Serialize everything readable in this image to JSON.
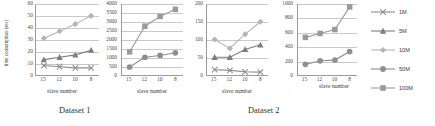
{
  "figure": {
    "captions": [
      {
        "label": "Dataset 1"
      },
      {
        "label": "Dataset 2"
      }
    ],
    "y_axis_title": "time consumption (sec)",
    "x_axis_title": "slave number"
  },
  "legend": {
    "position": "right",
    "items": [
      {
        "label": "1M",
        "marker": "cross-marker",
        "color": "#8c8c8c"
      },
      {
        "label": "5M",
        "marker": "triangle-marker",
        "color": "#7d7d7d"
      },
      {
        "label": "10M",
        "marker": "diamond-marker",
        "color": "#b5b5b5"
      },
      {
        "label": "50M",
        "marker": "circle-marker",
        "color": "#8f8f8f"
      },
      {
        "label": "100M",
        "marker": "square-marker",
        "color": "#9a9a9a"
      }
    ]
  },
  "chart_data": [
    {
      "type": "line",
      "title": "",
      "xlabel": "slave number",
      "ylabel": "time consumption (sec)",
      "categories": [
        "15",
        "12",
        "10",
        "8"
      ],
      "yticks": [
        0,
        10,
        20,
        30,
        40,
        50,
        60
      ],
      "ylim": [
        0,
        60
      ],
      "grid": true,
      "legend": "right",
      "series": [
        {
          "name": "10M",
          "marker": "diamond",
          "color": "#b5b5b5",
          "values": [
            31,
            37,
            43,
            50
          ]
        },
        {
          "name": "5M",
          "marker": "triangle",
          "color": "#7d7d7d",
          "values": [
            13,
            15,
            17,
            21
          ]
        },
        {
          "name": "1M",
          "marker": "cross",
          "color": "#8c8c8c",
          "values": [
            8,
            7,
            6,
            6
          ]
        }
      ]
    },
    {
      "type": "line",
      "title": "",
      "xlabel": "slave number",
      "ylabel": "",
      "categories": [
        "15",
        "12",
        "10",
        "8"
      ],
      "yticks": [
        0,
        500,
        1000,
        1500,
        2000,
        2500,
        3000,
        3500,
        4000
      ],
      "ylim": [
        0,
        4000
      ],
      "grid": true,
      "legend": "right",
      "series": [
        {
          "name": "100M",
          "marker": "square",
          "color": "#9a9a9a",
          "values": [
            1300,
            2750,
            3300,
            3700
          ]
        },
        {
          "name": "50M",
          "marker": "circle",
          "color": "#8f8f8f",
          "values": [
            450,
            1000,
            1100,
            1250
          ]
        }
      ]
    },
    {
      "type": "line",
      "title": "",
      "xlabel": "slave number",
      "ylabel": "",
      "categories": [
        "15",
        "12",
        "10",
        "8"
      ],
      "yticks": [
        0,
        50,
        100,
        150,
        200
      ],
      "ylim": [
        0,
        200
      ],
      "grid": true,
      "legend": "right",
      "series": [
        {
          "name": "10M",
          "marker": "diamond",
          "color": "#b5b5b5",
          "values": [
            100,
            75,
            115,
            150
          ]
        },
        {
          "name": "5M",
          "marker": "triangle",
          "color": "#7d7d7d",
          "values": [
            50,
            50,
            72,
            85
          ]
        },
        {
          "name": "1M",
          "marker": "cross",
          "color": "#8c8c8c",
          "values": [
            15,
            13,
            9,
            8
          ]
        }
      ]
    },
    {
      "type": "line",
      "title": "",
      "xlabel": "slave number",
      "ylabel": "",
      "categories": [
        "15",
        "12",
        "10",
        "8"
      ],
      "yticks": [
        0,
        200,
        400,
        600,
        800,
        1000
      ],
      "ylim": [
        0,
        1000
      ],
      "grid": true,
      "legend": "right",
      "series": [
        {
          "name": "100M",
          "marker": "square",
          "color": "#9a9a9a",
          "values": [
            530,
            585,
            640,
            960
          ]
        },
        {
          "name": "50M",
          "marker": "circle",
          "color": "#8f8f8f",
          "values": [
            150,
            200,
            210,
            330
          ]
        }
      ]
    }
  ]
}
